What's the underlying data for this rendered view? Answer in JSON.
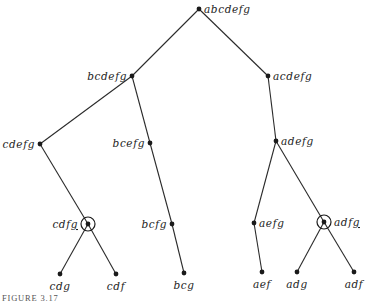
{
  "figure": {
    "caption": "FIGURE 3.17",
    "colors": {
      "line": "#2a2a2a",
      "dot": "#1a1a1a",
      "text": "#222222",
      "background": "#ffffff"
    },
    "nodes": [
      {
        "id": "abcdefg",
        "label": "abcdefg",
        "x": 199,
        "y": 9,
        "label_side": "right",
        "circled": false
      },
      {
        "id": "bcdefg",
        "label": "bcdefg",
        "x": 132,
        "y": 76,
        "label_side": "left",
        "circled": false
      },
      {
        "id": "acdefg",
        "label": "acdefg",
        "x": 268,
        "y": 76,
        "label_side": "right",
        "circled": false
      },
      {
        "id": "cdefg",
        "label": "cdefg",
        "x": 40,
        "y": 144,
        "label_side": "left",
        "circled": false
      },
      {
        "id": "bcefg",
        "label": "bcefg",
        "x": 150,
        "y": 143,
        "label_side": "left",
        "circled": false
      },
      {
        "id": "adefg",
        "label": "adefg",
        "x": 276,
        "y": 141,
        "label_side": "right",
        "circled": false
      },
      {
        "id": "cdfg",
        "label": "cdfg",
        "x": 88,
        "y": 224,
        "label_side": "left",
        "circled": true,
        "underline": "g"
      },
      {
        "id": "bcfg",
        "label": "bcfg",
        "x": 172,
        "y": 224,
        "label_side": "left",
        "circled": false
      },
      {
        "id": "aefg",
        "label": "aefg",
        "x": 254,
        "y": 223,
        "label_side": "right",
        "circled": false
      },
      {
        "id": "adfg",
        "label": "adfg",
        "x": 324,
        "y": 222,
        "label_side": "right",
        "circled": true,
        "underline": "g"
      },
      {
        "id": "cdg",
        "label": "cdg",
        "x": 60,
        "y": 274,
        "label_side": "below",
        "circled": false
      },
      {
        "id": "cdf",
        "label": "cdf",
        "x": 116,
        "y": 274,
        "label_side": "below",
        "circled": false
      },
      {
        "id": "bcg",
        "label": "bcg",
        "x": 184,
        "y": 273,
        "label_side": "below",
        "circled": false
      },
      {
        "id": "aef",
        "label": "aef",
        "x": 262,
        "y": 272,
        "label_side": "below",
        "circled": false
      },
      {
        "id": "adg",
        "label": "adg",
        "x": 297,
        "y": 272,
        "label_side": "below",
        "circled": false
      },
      {
        "id": "adf",
        "label": "adf",
        "x": 354,
        "y": 272,
        "label_side": "below",
        "circled": false
      }
    ],
    "edges": [
      [
        "abcdefg",
        "bcdefg"
      ],
      [
        "abcdefg",
        "acdefg"
      ],
      [
        "bcdefg",
        "cdefg"
      ],
      [
        "bcdefg",
        "bcefg"
      ],
      [
        "acdefg",
        "adefg"
      ],
      [
        "cdefg",
        "cdfg"
      ],
      [
        "bcefg",
        "bcfg"
      ],
      [
        "adefg",
        "aefg"
      ],
      [
        "adefg",
        "adfg"
      ],
      [
        "cdfg",
        "cdg"
      ],
      [
        "cdfg",
        "cdf"
      ],
      [
        "bcfg",
        "bcg"
      ],
      [
        "aefg",
        "aef"
      ],
      [
        "adfg",
        "adg"
      ],
      [
        "adfg",
        "adf"
      ]
    ]
  }
}
